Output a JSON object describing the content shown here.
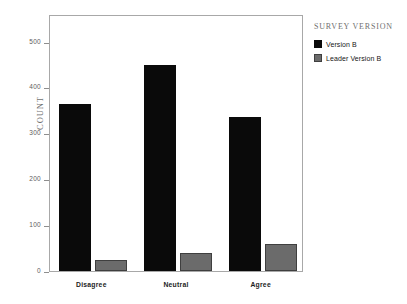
{
  "chart_data": {
    "type": "bar",
    "title": "",
    "subtitle": "",
    "xlabel": "",
    "ylabel": "Count",
    "categories": [
      "Disagree",
      "Neutral",
      "Agree"
    ],
    "series": [
      {
        "name": "Version B",
        "color": "#0a0a0a",
        "values": [
          364,
          449,
          335
        ]
      },
      {
        "name": "Leader Version B",
        "color": "#6b6b6b",
        "values": [
          25,
          40,
          58
        ]
      }
    ],
    "ylim": [
      0,
      560
    ],
    "yticks": [
      0,
      100,
      200,
      300,
      400,
      500
    ],
    "ytick_labels": [
      "0",
      "100",
      "200",
      "300",
      "400",
      "500"
    ],
    "grid": false,
    "legend_position": "right",
    "legend_title": "Survey Version"
  },
  "axes": {
    "y_title": "Count",
    "ticks": [
      {
        "value": 500,
        "label": "500"
      },
      {
        "value": 400,
        "label": "400"
      },
      {
        "value": 300,
        "label": "300"
      },
      {
        "value": 200,
        "label": "200"
      },
      {
        "value": 100,
        "label": "100"
      },
      {
        "value": 0,
        "label": "0"
      }
    ],
    "categories": [
      {
        "label": "Disagree"
      },
      {
        "label": "Neutral"
      },
      {
        "label": "Agree"
      }
    ]
  },
  "legend": {
    "title": "Survey Version",
    "items": [
      {
        "label": "Version B",
        "color": "#0a0a0a"
      },
      {
        "label": "Leader Version B",
        "color": "#6b6b6b"
      }
    ]
  }
}
